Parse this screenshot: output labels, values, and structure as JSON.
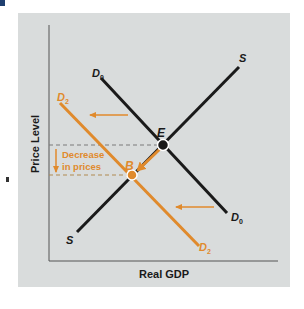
{
  "diagram": {
    "type": "aggregate-supply-demand",
    "axes": {
      "ylabel": "Price Level",
      "xlabel": "Real GDP"
    },
    "curves": [
      {
        "name": "S",
        "label_top": "S",
        "label_bottom": "S",
        "color": "#1a1a1a"
      },
      {
        "name": "D0",
        "label_top": "D",
        "label_top_sub": "0",
        "label_bottom": "D",
        "label_bottom_sub": "0",
        "color": "#1a1a1a"
      },
      {
        "name": "D2",
        "label_top": "D",
        "label_top_sub": "2",
        "label_bottom": "D",
        "label_bottom_sub": "2",
        "color": "#e08a2c"
      }
    ],
    "points": [
      {
        "name": "E",
        "label": "E",
        "color": "#1a1a1a"
      },
      {
        "name": "B",
        "label": "B",
        "color": "#e08a2c"
      }
    ],
    "annotation": {
      "line1": "Decrease",
      "line2": "in prices",
      "color": "#e08a2c"
    },
    "colors": {
      "panel_bg": "#d9dcdc",
      "accent": "#e08a2c",
      "line": "#1a1a1a",
      "axis": "#555555",
      "dashed": "#7a7a7a"
    }
  }
}
